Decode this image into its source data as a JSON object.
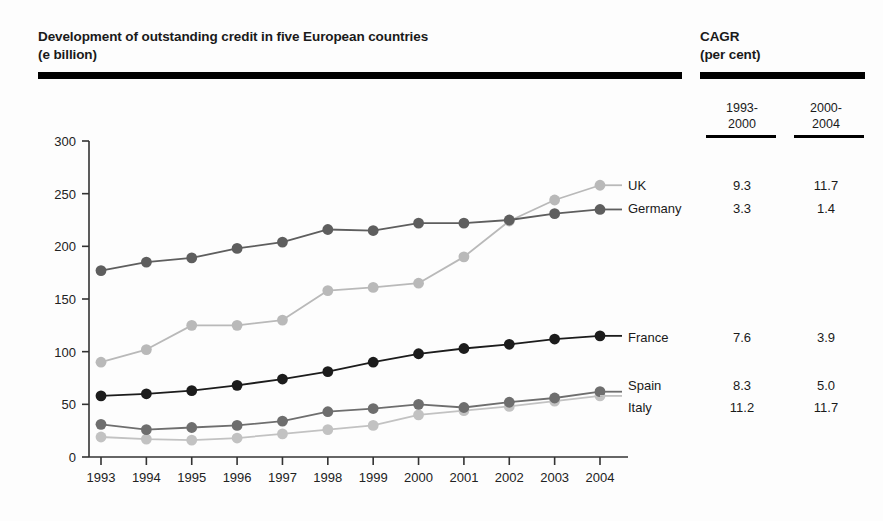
{
  "header": {
    "title": "Development of outstanding credit in five European countries\n(e billion)",
    "cagr_title": "CAGR\n(per cent)",
    "cagr_columns": [
      {
        "label": "1993-\n2000"
      },
      {
        "label": "2000-\n2004"
      }
    ]
  },
  "legend": [
    {
      "name": "UK",
      "color": "#b9b9b9",
      "cagr_1": "9.3",
      "cagr_2": "11.7"
    },
    {
      "name": "Germany",
      "color": "#5e5e5e",
      "cagr_1": "3.3",
      "cagr_2": "1.4"
    },
    {
      "name": "France",
      "color": "#1c1c1c",
      "cagr_1": "7.6",
      "cagr_2": "3.9"
    },
    {
      "name": "Spain",
      "color": "#6e6e6e",
      "cagr_1": "8.3",
      "cagr_2": "5.0"
    },
    {
      "name": "Italy",
      "color": "#c2c2c2",
      "cagr_1": "11.2",
      "cagr_2": "11.7"
    }
  ],
  "chart_data": {
    "type": "line",
    "title": "Development of outstanding credit in five European countries (e billion)",
    "xlabel": "",
    "ylabel": "",
    "grid": false,
    "legend_position": "right",
    "ylim": [
      0,
      300
    ],
    "yticks": [
      0,
      50,
      100,
      150,
      200,
      250,
      300
    ],
    "categories": [
      "1993",
      "1994",
      "1995",
      "1996",
      "1997",
      "1998",
      "1999",
      "2000",
      "2001",
      "2002",
      "2003",
      "2004"
    ],
    "series": [
      {
        "name": "UK",
        "color": "#b9b9b9",
        "values": [
          90,
          102,
          125,
          125,
          130,
          158,
          161,
          165,
          190,
          224,
          244,
          258
        ]
      },
      {
        "name": "Germany",
        "color": "#5e5e5e",
        "values": [
          177,
          185,
          189,
          198,
          204,
          216,
          215,
          222,
          222,
          225,
          231,
          235
        ]
      },
      {
        "name": "France",
        "color": "#1c1c1c",
        "values": [
          58,
          60,
          63,
          68,
          74,
          81,
          90,
          98,
          103,
          107,
          112,
          115
        ]
      },
      {
        "name": "Spain",
        "color": "#6e6e6e",
        "values": [
          31,
          26,
          28,
          30,
          34,
          43,
          46,
          50,
          47,
          52,
          56,
          62
        ]
      },
      {
        "name": "Italy",
        "color": "#c2c2c2",
        "values": [
          19,
          17,
          16,
          18,
          22,
          26,
          30,
          40,
          44,
          48,
          53,
          58
        ]
      }
    ]
  }
}
